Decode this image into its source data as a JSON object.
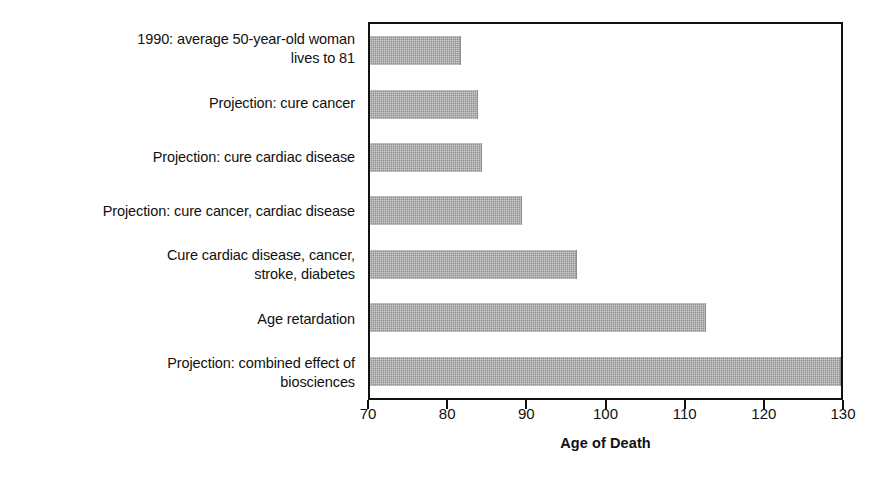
{
  "chart_data": {
    "type": "bar",
    "orientation": "horizontal",
    "title": "",
    "xlabel": "Age of Death",
    "ylabel": "",
    "xlim": [
      70,
      130
    ],
    "xticks": [
      70,
      80,
      90,
      100,
      110,
      120,
      130
    ],
    "xticklabels": [
      "70",
      "80",
      "90",
      "100",
      "110",
      "120",
      "130"
    ],
    "grid": false,
    "legend": false,
    "bar_color": "#9a9a9a",
    "frame_color": "#111111",
    "categories": [
      "1990: average 50-year-old woman\nlives to 81",
      "Projection: cure cancer",
      "Projection: cure cardiac disease",
      "Projection: cure cancer, cardiac disease",
      "Cure cardiac disease, cancer,\nstroke, diabetes",
      "Age retardation",
      "Projection: combined effect of\nbiosciences"
    ],
    "values": [
      81.5,
      83.7,
      84.1,
      89.2,
      96.2,
      112.5,
      130.0
    ]
  }
}
